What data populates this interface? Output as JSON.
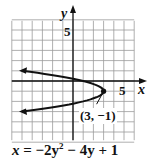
{
  "chart_data": {
    "type": "line",
    "title": "",
    "equation": "x = −2y² − 4y + 1",
    "xlabel": "x",
    "ylabel": "y",
    "xlim": [
      -6,
      6
    ],
    "ylim": [
      -6,
      6
    ],
    "grid": true,
    "x_tick_label": "5",
    "y_tick_label": "5",
    "series": [
      {
        "name": "x = -2y^2 - 4y + 1",
        "points": [
          {
            "x": -5,
            "y": 1.0
          },
          {
            "x": -2,
            "y": 0.22
          },
          {
            "x": 0,
            "y": 0.22
          },
          {
            "x": 1,
            "y": 0
          },
          {
            "x": 3,
            "y": -1
          },
          {
            "x": 1,
            "y": -2
          },
          {
            "x": 0,
            "y": -2.22
          },
          {
            "x": -5,
            "y": -3.0
          }
        ],
        "vertex": {
          "x": 3,
          "y": -1
        },
        "arrows_at_ends": true
      }
    ],
    "annotations": [
      {
        "text": "(3, −1)",
        "target": {
          "x": 3,
          "y": -1
        }
      }
    ]
  },
  "labels": {
    "x_axis": "x",
    "y_axis": "y",
    "x_tick": "5",
    "y_tick": "5",
    "vertex": "(3, −1)",
    "equation_lhs": "x",
    "equation_rhs": " = −2y",
    "equation_exp": "2",
    "equation_tail": " − 4y + 1"
  }
}
